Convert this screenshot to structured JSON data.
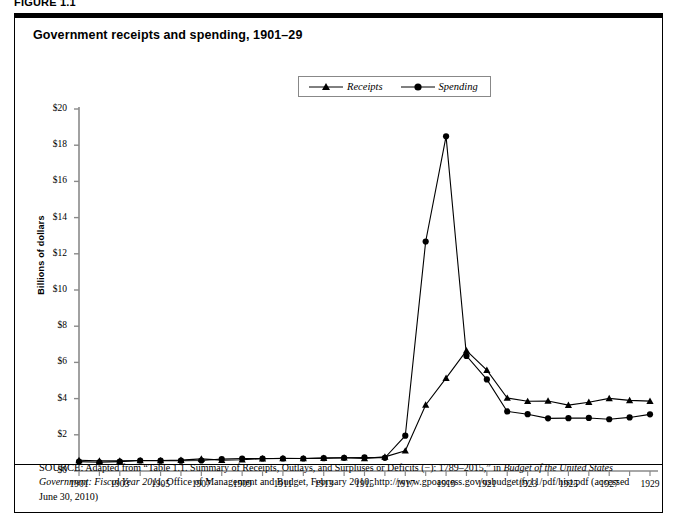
{
  "figure": {
    "label": "FIGURE 1.1",
    "title": "Government receipts and spending, 1901–29"
  },
  "legend": {
    "position": "top-center",
    "items": [
      {
        "label": "Receipts",
        "marker": "triangle-marker",
        "color": "#000000"
      },
      {
        "label": "Spending",
        "marker": "circle-marker",
        "color": "#000000"
      }
    ]
  },
  "source": {
    "prefix": "SOURCE:",
    "part1": " Adapted from “Table 1.1. Summary of Receipts, Outlays, and Surpluses or Deficits (−): 1789–2015,” in ",
    "italic1": "Budget of the United States Government: Fiscal Year 2011",
    "part2": ", Office of Management and Budget, February 2010, http://www.gpoaccess.gov/usbudget/fy11/pdf/hist.pdf (accessed June 30, 2010)"
  },
  "chart_data": {
    "type": "line",
    "title": "Government receipts and spending, 1901–29",
    "xlabel": "",
    "ylabel": "Billions of dollars",
    "xlim": [
      1901,
      1929
    ],
    "ylim": [
      0,
      20
    ],
    "ytick_step": 2,
    "ytick_labels": [
      "$0",
      "$2",
      "$4",
      "$6",
      "$8",
      "$10",
      "$12",
      "$14",
      "$16",
      "$18",
      "$20"
    ],
    "ytick_values": [
      0,
      2,
      4,
      6,
      8,
      10,
      12,
      14,
      16,
      18,
      20
    ],
    "xtick_labels": [
      "1901",
      "1903",
      "1905",
      "1907",
      "1909",
      "1911",
      "1913",
      "1915",
      "1917",
      "1919",
      "1921",
      "1923",
      "1925",
      "1927",
      "1929"
    ],
    "xtick_values": [
      1901,
      1903,
      1905,
      1907,
      1909,
      1911,
      1913,
      1915,
      1917,
      1919,
      1921,
      1923,
      1925,
      1927,
      1929
    ],
    "x": [
      1901,
      1902,
      1903,
      1904,
      1905,
      1906,
      1907,
      1908,
      1909,
      1910,
      1911,
      1912,
      1913,
      1914,
      1915,
      1916,
      1917,
      1918,
      1919,
      1920,
      1921,
      1922,
      1923,
      1924,
      1925,
      1926,
      1927,
      1928,
      1929
    ],
    "grid": false,
    "legend_position": "top-center",
    "series": [
      {
        "name": "Receipts",
        "marker": "triangle",
        "color": "#000000",
        "values": [
          0.59,
          0.56,
          0.56,
          0.58,
          0.58,
          0.6,
          0.67,
          0.6,
          0.62,
          0.68,
          0.7,
          0.69,
          0.71,
          0.73,
          0.7,
          0.78,
          1.12,
          3.65,
          5.13,
          6.65,
          5.57,
          4.03,
          3.85,
          3.87,
          3.64,
          3.8,
          4.01,
          3.9,
          3.86
        ]
      },
      {
        "name": "Spending",
        "marker": "circle",
        "color": "#000000",
        "values": [
          0.52,
          0.48,
          0.52,
          0.58,
          0.57,
          0.57,
          0.58,
          0.66,
          0.69,
          0.69,
          0.69,
          0.69,
          0.71,
          0.73,
          0.75,
          0.73,
          1.95,
          12.68,
          18.49,
          6.36,
          5.06,
          3.29,
          3.14,
          2.91,
          2.92,
          2.93,
          2.86,
          2.96,
          3.13
        ]
      }
    ]
  }
}
